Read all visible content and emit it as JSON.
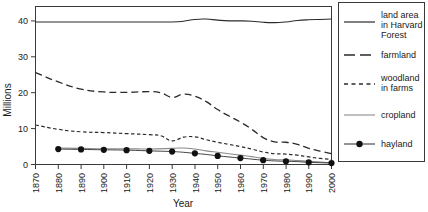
{
  "chart_data": {
    "type": "line",
    "title": "",
    "xlabel": "Year",
    "ylabel": "Millions",
    "xlim": [
      1870,
      2000
    ],
    "ylim": [
      0,
      44
    ],
    "xticks": [
      1870,
      1880,
      1890,
      1900,
      1910,
      1920,
      1930,
      1940,
      1950,
      1960,
      1970,
      1980,
      1990,
      2000
    ],
    "yticks": [
      0,
      10,
      20,
      30,
      40
    ],
    "grid": false,
    "legend_position": "right-outside",
    "series": [
      {
        "name": "land area in Harvard Forest",
        "style": "solid",
        "color": "#2b2b2b",
        "x": [
          1870,
          1880,
          1890,
          1900,
          1910,
          1920,
          1930,
          1935,
          1940,
          1945,
          1950,
          1955,
          1960,
          1965,
          1970,
          1975,
          1980,
          1985,
          1990,
          1995,
          2000
        ],
        "values": [
          39.7,
          39.7,
          39.7,
          39.7,
          39.7,
          39.7,
          39.7,
          39.9,
          40.4,
          40.5,
          40.2,
          40.0,
          40.0,
          39.9,
          39.6,
          39.5,
          39.7,
          40.1,
          40.3,
          40.4,
          40.5
        ]
      },
      {
        "name": "farmland",
        "style": "dashed-long",
        "color": "#2b2b2b",
        "x": [
          1870,
          1880,
          1890,
          1900,
          1910,
          1920,
          1925,
          1930,
          1935,
          1940,
          1945,
          1950,
          1955,
          1960,
          1965,
          1970,
          1975,
          1980,
          1985,
          1990,
          1995,
          2000
        ],
        "values": [
          25.6,
          23.0,
          21.0,
          20.2,
          20.1,
          20.3,
          20.0,
          18.7,
          19.6,
          19.0,
          17.5,
          15.3,
          13.5,
          11.8,
          9.8,
          7.5,
          6.3,
          6.2,
          5.6,
          4.5,
          3.7,
          3.0
        ]
      },
      {
        "name": "woodland in farms",
        "style": "dashed-short",
        "color": "#2b2b2b",
        "x": [
          1870,
          1880,
          1890,
          1900,
          1910,
          1920,
          1925,
          1930,
          1935,
          1940,
          1945,
          1950,
          1955,
          1960,
          1965,
          1970,
          1975,
          1980,
          1985,
          1990,
          1995,
          2000
        ],
        "values": [
          11.0,
          9.8,
          9.1,
          8.9,
          8.6,
          8.3,
          8.0,
          6.6,
          7.6,
          7.7,
          6.9,
          6.2,
          5.6,
          5.0,
          4.3,
          3.5,
          3.0,
          2.9,
          2.6,
          2.1,
          1.7,
          1.4
        ]
      },
      {
        "name": "cropland",
        "style": "solid-thin",
        "color": "#8a8a8a",
        "x": [
          1880,
          1890,
          1900,
          1910,
          1920,
          1930,
          1935,
          1940,
          1945,
          1950,
          1955,
          1960,
          1965,
          1970,
          1975,
          1980,
          1985,
          1990,
          1995,
          2000
        ],
        "values": [
          4.6,
          4.5,
          4.4,
          4.4,
          4.3,
          4.5,
          4.6,
          4.3,
          3.8,
          3.4,
          3.0,
          2.6,
          2.2,
          1.7,
          1.4,
          1.3,
          1.1,
          0.9,
          0.7,
          0.5
        ]
      },
      {
        "name": "hayland",
        "style": "line-with-dot-markers",
        "color": "#111111",
        "x": [
          1880,
          1890,
          1900,
          1910,
          1920,
          1930,
          1935,
          1940,
          1945,
          1950,
          1955,
          1960,
          1965,
          1970,
          1975,
          1980,
          1985,
          1990,
          1995,
          2000
        ],
        "values": [
          4.3,
          4.2,
          4.1,
          4.0,
          3.8,
          3.6,
          3.4,
          3.1,
          2.8,
          2.4,
          2.1,
          1.8,
          1.5,
          1.2,
          1.0,
          0.9,
          0.8,
          0.6,
          0.5,
          0.4
        ]
      }
    ]
  },
  "axes": {
    "ylabel": "Millions",
    "xlabel": "Year",
    "xtick_labels": [
      "1870",
      "1880",
      "1890",
      "1900",
      "1910",
      "1920",
      "1930",
      "1940",
      "1950",
      "1960",
      "1970",
      "1980",
      "1990",
      "2000"
    ],
    "ytick_labels": [
      "0",
      "10",
      "20",
      "30",
      "40"
    ]
  },
  "legend": {
    "items": [
      {
        "label_line1": "land area",
        "label_line2": "in Harvard",
        "label_line3": "Forest",
        "style": "solid"
      },
      {
        "label_line1": "farmland",
        "label_line2": "",
        "label_line3": "",
        "style": "dashed-long"
      },
      {
        "label_line1": "woodland",
        "label_line2": "in farms",
        "label_line3": "",
        "style": "dashed-short"
      },
      {
        "label_line1": "cropland",
        "label_line2": "",
        "label_line3": "",
        "style": "solid-thin"
      },
      {
        "label_line1": "hayland",
        "label_line2": "",
        "label_line3": "",
        "style": "dot-line"
      }
    ]
  }
}
